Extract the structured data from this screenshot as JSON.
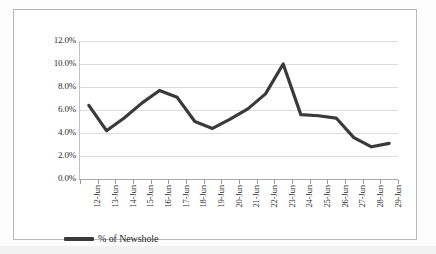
{
  "chart_data": {
    "type": "line",
    "title": "",
    "subtitle": "",
    "xlabel": "",
    "ylabel": "",
    "grid": true,
    "legend_position": "bottom-left",
    "ylim": [
      0,
      12
    ],
    "ytick_labels": [
      "12.0%",
      "10.0%",
      "8.0%",
      "6.0%",
      "4.0%",
      "2.0%",
      "0.0%"
    ],
    "ytick_values": [
      12,
      10,
      8,
      6,
      4,
      2,
      0
    ],
    "categories": [
      "12-Jun",
      "13-Jun",
      "14-Jun",
      "15-Jun",
      "16-Jun",
      "17-Jun",
      "18-Jun",
      "19-Jun",
      "20-Jun",
      "21-Jun",
      "22-Jun",
      "23-Jun",
      "24-Jun",
      "25-Jun",
      "26-Jun",
      "27-Jun",
      "28-Jun",
      "29-Jun"
    ],
    "series": [
      {
        "name": "% of Newshole",
        "color": "#3a3a3a",
        "values": [
          6.4,
          4.2,
          5.3,
          6.6,
          7.7,
          7.1,
          5.0,
          4.4,
          5.2,
          6.1,
          7.4,
          10.0,
          5.6,
          5.5,
          5.3,
          3.6,
          2.8,
          3.1
        ]
      }
    ]
  },
  "legend": {
    "entries": [
      {
        "label": "% of Newshole",
        "color": "#3a3a3a"
      }
    ]
  }
}
